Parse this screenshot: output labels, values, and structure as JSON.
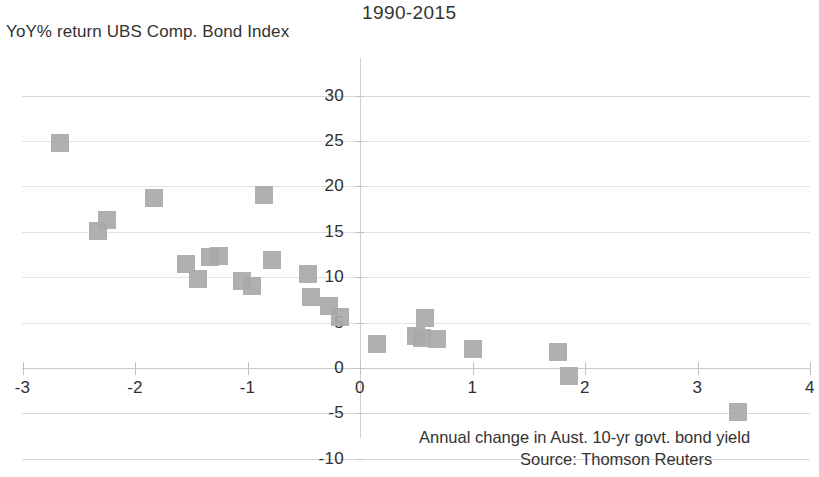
{
  "chart_data": {
    "type": "scatter",
    "title": "1990-2015",
    "xlabel": "Annual change in Aust. 10-yr govt. bond yield",
    "ylabel": "YoY% return UBS Comp. Bond Index",
    "source": "Source: Thomson Reuters",
    "xlim": [
      -3,
      4
    ],
    "ylim": [
      -10,
      30
    ],
    "xticks": [
      -3,
      -2,
      -1,
      0,
      1,
      2,
      3,
      4
    ],
    "xtick_labels": [
      "-3",
      "-2",
      "-1",
      "0",
      "1",
      "2",
      "3",
      "4"
    ],
    "yticks": [
      30,
      25,
      20,
      15,
      10,
      5,
      0,
      -5,
      -10
    ],
    "ytick_labels": [
      "30",
      "25",
      "20",
      "15",
      "10",
      "5",
      "0",
      "-5",
      "-10"
    ],
    "grid": true,
    "legend": "none",
    "marker_color": "#a9a9a9",
    "marker_shape": "square",
    "points": [
      {
        "x": -2.67,
        "y": 24.8
      },
      {
        "x": -2.33,
        "y": 15.1
      },
      {
        "x": -2.25,
        "y": 16.3
      },
      {
        "x": -1.83,
        "y": 18.7
      },
      {
        "x": -1.55,
        "y": 11.4
      },
      {
        "x": -1.44,
        "y": 9.8
      },
      {
        "x": -1.33,
        "y": 12.2
      },
      {
        "x": -1.25,
        "y": 12.3
      },
      {
        "x": -1.05,
        "y": 9.6
      },
      {
        "x": -0.96,
        "y": 9.0
      },
      {
        "x": -0.85,
        "y": 19.1
      },
      {
        "x": -0.78,
        "y": 11.9
      },
      {
        "x": -0.46,
        "y": 10.3
      },
      {
        "x": -0.44,
        "y": 7.8
      },
      {
        "x": -0.28,
        "y": 6.8
      },
      {
        "x": -0.18,
        "y": 5.6
      },
      {
        "x": 0.15,
        "y": 2.6
      },
      {
        "x": 0.5,
        "y": 3.5
      },
      {
        "x": 0.55,
        "y": 3.3
      },
      {
        "x": 0.58,
        "y": 5.5
      },
      {
        "x": 0.68,
        "y": 3.2
      },
      {
        "x": 1.0,
        "y": 2.1
      },
      {
        "x": 1.76,
        "y": 1.8
      },
      {
        "x": 1.86,
        "y": -0.9
      },
      {
        "x": 3.36,
        "y": -4.8
      }
    ]
  }
}
